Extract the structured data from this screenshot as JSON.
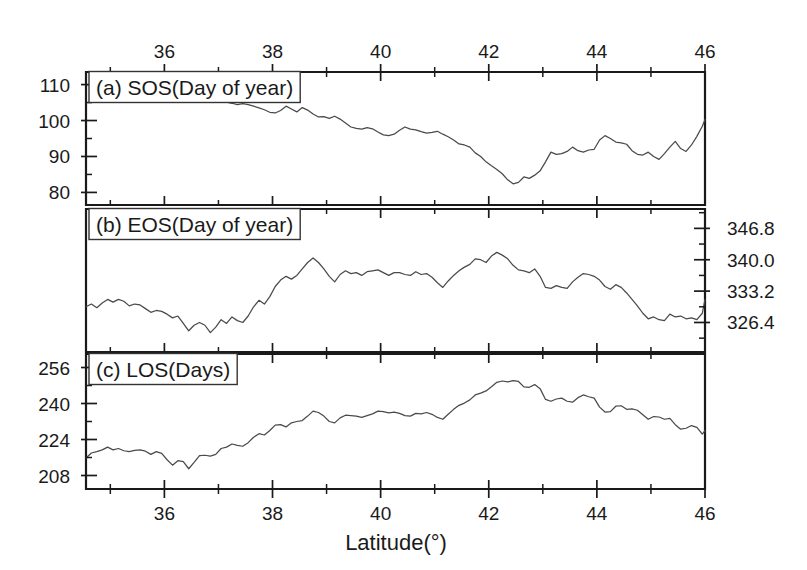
{
  "figure": {
    "background_color": "#ffffff",
    "line_color": "#4a4a4a",
    "axis_color": "#1a1a1a",
    "xlabel": "Latitude(°)",
    "x_ticks_top": [
      "36",
      "38",
      "40",
      "42",
      "44",
      "46"
    ],
    "x_ticks_bottom": [
      "36",
      "38",
      "40",
      "42",
      "44",
      "46"
    ]
  },
  "panels": {
    "a": {
      "tag": "(a)",
      "title": "SOS(Day of year)",
      "label": "(a)  SOS(Day of year)",
      "y_ticks": [
        "110",
        "100",
        "90",
        "80"
      ],
      "y_side": "left"
    },
    "b": {
      "tag": "(b)",
      "title": "EOS(Day of year)",
      "label": "(b)  EOS(Day of year)",
      "y_ticks": [
        "346.8",
        "340.0",
        "333.2",
        "326.4"
      ],
      "y_side": "right"
    },
    "c": {
      "tag": "(c)",
      "title": "LOS(Days)",
      "label": "(c)  LOS(Days)",
      "y_ticks": [
        "256",
        "240",
        "224",
        "208"
      ],
      "y_side": "left"
    }
  },
  "chart_data": [
    {
      "type": "line",
      "panel": "a",
      "title": "SOS(Day of year)",
      "xlabel": "Latitude(°)",
      "ylabel": "SOS (Day of year)",
      "xlim": [
        34.55,
        46.0
      ],
      "ylim": [
        76.5,
        113.5
      ],
      "xticks": [
        36,
        38,
        40,
        42,
        44,
        46
      ],
      "yticks": [
        80,
        90,
        100,
        110
      ],
      "grid": false,
      "legend": false,
      "x": [
        34.55,
        34.65,
        34.75,
        34.85,
        34.95,
        35.05,
        35.15,
        35.25,
        35.35,
        35.45,
        35.55,
        35.65,
        35.75,
        35.85,
        35.95,
        36.05,
        36.15,
        36.25,
        36.35,
        36.45,
        36.55,
        36.65,
        36.75,
        36.85,
        36.95,
        37.05,
        37.15,
        37.25,
        37.35,
        37.45,
        37.55,
        37.65,
        37.75,
        37.85,
        37.95,
        38.05,
        38.15,
        38.25,
        38.35,
        38.45,
        38.55,
        38.65,
        38.75,
        38.85,
        38.95,
        39.05,
        39.15,
        39.25,
        39.35,
        39.45,
        39.55,
        39.65,
        39.75,
        39.85,
        39.95,
        40.05,
        40.15,
        40.25,
        40.35,
        40.45,
        40.55,
        40.65,
        40.75,
        40.85,
        40.95,
        41.05,
        41.15,
        41.25,
        41.35,
        41.45,
        41.55,
        41.65,
        41.75,
        41.85,
        41.95,
        42.05,
        42.15,
        42.25,
        42.35,
        42.45,
        42.55,
        42.65,
        42.75,
        42.85,
        42.95,
        43.05,
        43.15,
        43.25,
        43.35,
        43.45,
        43.55,
        43.65,
        43.75,
        43.85,
        43.95,
        44.05,
        44.15,
        44.25,
        44.35,
        44.45,
        44.55,
        44.65,
        44.75,
        44.85,
        44.95,
        45.05,
        45.15,
        45.25,
        45.35,
        45.45,
        45.55,
        45.65,
        45.75,
        45.85,
        45.95,
        46.0
      ],
      "values": [
        110.0,
        110.0,
        109.9,
        109.8,
        109.6,
        109.3,
        109.4,
        109.6,
        109.7,
        109.8,
        109.8,
        109.8,
        109.8,
        109.8,
        109.7,
        109.6,
        109.3,
        108.0,
        107.4,
        107.0,
        107.2,
        106.5,
        106.3,
        106.0,
        105.8,
        105.3,
        105.1,
        104.8,
        104.4,
        104.7,
        104.4,
        104.0,
        103.5,
        103.0,
        102.3,
        102.1,
        102.8,
        104.0,
        103.2,
        102.4,
        103.6,
        102.9,
        101.8,
        101.0,
        101.1,
        100.6,
        101.2,
        100.4,
        99.3,
        98.2,
        97.8,
        97.6,
        98.0,
        97.7,
        96.8,
        96.0,
        95.8,
        96.2,
        97.3,
        98.2,
        97.6,
        97.4,
        96.9,
        96.5,
        96.7,
        97.0,
        96.2,
        95.5,
        94.6,
        93.5,
        93.2,
        92.6,
        91.0,
        90.0,
        88.5,
        87.4,
        86.4,
        85.2,
        83.5,
        82.4,
        82.8,
        84.3,
        83.9,
        84.8,
        86.0,
        88.5,
        91.2,
        90.6,
        90.8,
        91.4,
        92.6,
        91.6,
        91.2,
        91.8,
        92.0,
        94.6,
        95.8,
        95.0,
        94.0,
        93.8,
        93.4,
        91.6,
        90.6,
        90.4,
        91.2,
        90.0,
        89.2,
        90.8,
        92.6,
        94.2,
        92.2,
        91.4,
        93.2,
        95.6,
        98.4,
        100.3
      ]
    },
    {
      "type": "line",
      "panel": "b",
      "title": "EOS(Day of year)",
      "xlabel": "Latitude(°)",
      "ylabel": "EOS (Day of year)",
      "xlim": [
        34.55,
        46.0
      ],
      "ylim": [
        320.0,
        351.0
      ],
      "xticks": [
        36,
        38,
        40,
        42,
        44,
        46
      ],
      "yticks": [
        326.4,
        333.2,
        340.0,
        346.8
      ],
      "grid": false,
      "legend": false,
      "x": [
        34.55,
        34.65,
        34.75,
        34.85,
        34.95,
        35.05,
        35.15,
        35.25,
        35.35,
        35.45,
        35.55,
        35.65,
        35.75,
        35.85,
        35.95,
        36.05,
        36.15,
        36.25,
        36.35,
        36.45,
        36.55,
        36.65,
        36.75,
        36.85,
        36.95,
        37.05,
        37.15,
        37.25,
        37.35,
        37.45,
        37.55,
        37.65,
        37.75,
        37.85,
        37.95,
        38.05,
        38.15,
        38.25,
        38.35,
        38.45,
        38.55,
        38.65,
        38.75,
        38.85,
        38.95,
        39.05,
        39.15,
        39.25,
        39.35,
        39.45,
        39.55,
        39.65,
        39.75,
        39.85,
        39.95,
        40.05,
        40.15,
        40.25,
        40.35,
        40.45,
        40.55,
        40.65,
        40.75,
        40.85,
        40.95,
        41.05,
        41.15,
        41.25,
        41.35,
        41.45,
        41.55,
        41.65,
        41.75,
        41.85,
        41.95,
        42.05,
        42.15,
        42.25,
        42.35,
        42.45,
        42.55,
        42.65,
        42.75,
        42.85,
        42.95,
        43.05,
        43.15,
        43.25,
        43.35,
        43.45,
        43.55,
        43.65,
        43.75,
        43.85,
        43.95,
        44.05,
        44.15,
        44.25,
        44.35,
        44.45,
        44.55,
        44.65,
        44.75,
        44.85,
        44.95,
        45.05,
        45.15,
        45.25,
        45.35,
        45.45,
        45.55,
        45.65,
        45.75,
        45.85,
        45.95,
        46.0
      ],
      "values": [
        329.8,
        330.4,
        329.6,
        330.6,
        331.4,
        330.8,
        331.4,
        331.0,
        330.0,
        330.4,
        330.2,
        329.4,
        328.6,
        329.0,
        328.8,
        328.2,
        327.4,
        327.8,
        326.2,
        324.6,
        325.8,
        326.4,
        325.8,
        324.2,
        325.4,
        327.0,
        326.2,
        327.6,
        326.8,
        326.4,
        327.8,
        329.8,
        331.2,
        330.4,
        332.0,
        334.2,
        335.6,
        336.4,
        335.8,
        336.6,
        338.0,
        339.4,
        340.4,
        339.4,
        338.0,
        336.4,
        335.2,
        336.8,
        337.6,
        337.0,
        337.2,
        336.6,
        337.4,
        337.6,
        337.8,
        337.2,
        336.6,
        337.2,
        337.2,
        336.8,
        336.6,
        337.4,
        336.8,
        337.0,
        336.2,
        335.0,
        334.0,
        335.4,
        336.6,
        337.6,
        338.4,
        339.0,
        340.2,
        340.0,
        339.4,
        340.8,
        341.6,
        341.0,
        340.2,
        338.8,
        337.8,
        337.6,
        337.2,
        338.0,
        336.4,
        334.0,
        333.8,
        334.4,
        334.0,
        333.8,
        335.2,
        336.2,
        337.0,
        336.8,
        336.4,
        335.6,
        334.2,
        333.6,
        334.6,
        334.0,
        332.8,
        331.4,
        330.0,
        328.4,
        327.2,
        327.6,
        327.0,
        326.8,
        328.2,
        327.6,
        327.8,
        327.2,
        327.4,
        327.0,
        328.4,
        331.4
      ]
    },
    {
      "type": "line",
      "panel": "c",
      "title": "LOS(Days)",
      "xlabel": "Latitude(°)",
      "ylabel": "LOS (Days)",
      "xlim": [
        34.55,
        46.0
      ],
      "ylim": [
        202.0,
        262.0
      ],
      "xticks": [
        36,
        38,
        40,
        42,
        44,
        46
      ],
      "yticks": [
        208,
        224,
        240,
        256
      ],
      "grid": false,
      "legend": false,
      "x": [
        34.55,
        34.65,
        34.75,
        34.85,
        34.95,
        35.05,
        35.15,
        35.25,
        35.35,
        35.45,
        35.55,
        35.65,
        35.75,
        35.85,
        35.95,
        36.05,
        36.15,
        36.25,
        36.35,
        36.45,
        36.55,
        36.65,
        36.75,
        36.85,
        36.95,
        37.05,
        37.15,
        37.25,
        37.35,
        37.45,
        37.55,
        37.65,
        37.75,
        37.85,
        37.95,
        38.05,
        38.15,
        38.25,
        38.35,
        38.45,
        38.55,
        38.65,
        38.75,
        38.85,
        38.95,
        39.05,
        39.15,
        39.25,
        39.35,
        39.45,
        39.55,
        39.65,
        39.75,
        39.85,
        39.95,
        40.05,
        40.15,
        40.25,
        40.35,
        40.45,
        40.55,
        40.65,
        40.75,
        40.85,
        40.95,
        41.05,
        41.15,
        41.25,
        41.35,
        41.45,
        41.55,
        41.65,
        41.75,
        41.85,
        41.95,
        42.05,
        42.15,
        42.25,
        42.35,
        42.45,
        42.55,
        42.65,
        42.75,
        42.85,
        42.95,
        43.05,
        43.15,
        43.25,
        43.35,
        43.45,
        43.55,
        43.65,
        43.75,
        43.85,
        43.95,
        44.05,
        44.15,
        44.25,
        44.35,
        44.45,
        44.55,
        44.65,
        44.75,
        44.85,
        44.95,
        45.05,
        45.15,
        45.25,
        45.35,
        45.45,
        45.55,
        45.65,
        45.75,
        45.85,
        45.95,
        46.0
      ],
      "values": [
        215.8,
        218.0,
        218.6,
        219.4,
        220.6,
        219.4,
        220.0,
        219.0,
        218.6,
        219.2,
        219.4,
        218.8,
        217.4,
        218.6,
        217.8,
        215.0,
        212.6,
        214.6,
        214.2,
        211.0,
        213.8,
        216.8,
        217.0,
        216.6,
        217.4,
        220.0,
        220.6,
        222.0,
        221.4,
        221.0,
        222.6,
        225.0,
        226.6,
        226.0,
        228.0,
        230.4,
        230.6,
        229.6,
        231.4,
        232.0,
        232.4,
        234.4,
        236.6,
        236.0,
        234.4,
        232.0,
        231.4,
        233.6,
        234.8,
        234.6,
        234.4,
        233.8,
        234.6,
        235.4,
        236.6,
        236.4,
        235.8,
        236.2,
        235.6,
        234.6,
        234.4,
        235.6,
        235.4,
        236.0,
        235.2,
        233.8,
        233.0,
        235.2,
        237.4,
        239.2,
        240.2,
        241.6,
        243.8,
        244.6,
        245.6,
        247.4,
        249.4,
        250.0,
        249.6,
        250.2,
        249.8,
        247.4,
        247.2,
        248.4,
        246.6,
        241.8,
        241.0,
        242.0,
        242.4,
        241.0,
        240.6,
        242.6,
        243.8,
        243.0,
        242.4,
        238.4,
        236.2,
        236.4,
        238.8,
        239.0,
        237.4,
        237.6,
        237.0,
        235.0,
        233.0,
        234.2,
        234.0,
        233.0,
        233.4,
        230.6,
        228.6,
        229.0,
        230.2,
        229.4,
        226.4,
        228.0
      ]
    }
  ]
}
